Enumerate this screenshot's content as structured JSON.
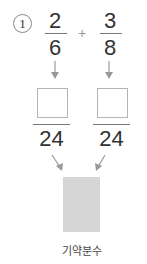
{
  "problem": {
    "number": "1",
    "fraction_a": {
      "numerator": "2",
      "denominator": "6"
    },
    "operator": "+",
    "fraction_b": {
      "numerator": "3",
      "denominator": "8"
    },
    "common_denominator_left": "24",
    "common_denominator_right": "24",
    "result_label": "기약분수"
  },
  "colors": {
    "arrow": "#999999",
    "result_box": "#d6d6d6",
    "answer_box_border": "#b5b5b5"
  }
}
